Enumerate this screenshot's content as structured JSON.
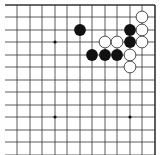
{
  "board": {
    "description": "Go board fragment (upper-right corner region)",
    "grid": {
      "x_lines": [
        5,
        17,
        30,
        42,
        55,
        67,
        80,
        92,
        105,
        117,
        130,
        142,
        155
      ],
      "y_lines": [
        5,
        17,
        30,
        42,
        55,
        67,
        80,
        92,
        105,
        117,
        130,
        142,
        155
      ],
      "top_edge": true,
      "right_edge": true,
      "line_color": "#333333"
    },
    "star_points": [
      {
        "col": 3,
        "row": 3
      },
      {
        "col": 3,
        "row": 9
      },
      {
        "col": 9,
        "row": 9
      }
    ],
    "stones": [
      {
        "color": "black",
        "col": 6,
        "row": 2
      },
      {
        "color": "white",
        "col": 11,
        "row": 1
      },
      {
        "color": "black",
        "col": 10,
        "row": 2
      },
      {
        "color": "white",
        "col": 11,
        "row": 2
      },
      {
        "color": "white",
        "col": 8,
        "row": 3
      },
      {
        "color": "white",
        "col": 9,
        "row": 3
      },
      {
        "color": "black",
        "col": 10,
        "row": 3
      },
      {
        "color": "white",
        "col": 11,
        "row": 3
      },
      {
        "color": "black",
        "col": 7,
        "row": 4
      },
      {
        "color": "black",
        "col": 8,
        "row": 4
      },
      {
        "color": "black",
        "col": 9,
        "row": 4
      },
      {
        "color": "white",
        "col": 10,
        "row": 4
      },
      {
        "color": "white",
        "col": 10,
        "row": 5
      }
    ],
    "colors": {
      "black_stone": "#111111",
      "white_stone_fill": "#ffffff",
      "white_stone_stroke": "#222222",
      "background": "#ffffff"
    }
  }
}
